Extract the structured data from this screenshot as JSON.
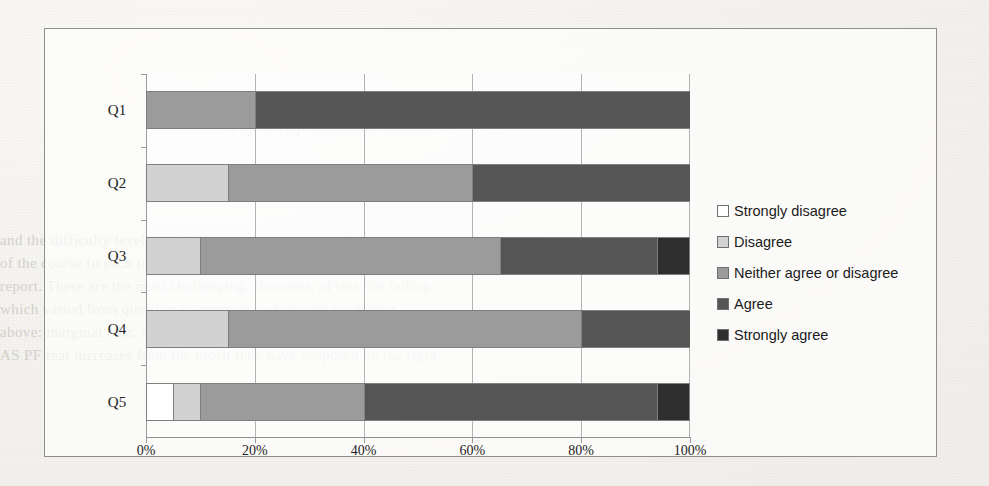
{
  "chart_data": {
    "type": "bar",
    "subtype": "stacked-horizontal-100-percent",
    "title": "",
    "xlabel": "",
    "ylabel": "",
    "categories": [
      "Q1",
      "Q2",
      "Q3",
      "Q4",
      "Q5"
    ],
    "xlim": [
      0,
      100
    ],
    "xticks": [
      "0%",
      "20%",
      "40%",
      "60%",
      "80%",
      "100%"
    ],
    "xtick_values": [
      0,
      20,
      40,
      60,
      80,
      100
    ],
    "grid": "vertical",
    "legend_position": "right",
    "series": [
      {
        "name": "Strongly disagree",
        "color": "#ffffff",
        "values": [
          0,
          0,
          0,
          0,
          5
        ]
      },
      {
        "name": "Disagree",
        "color": "#d2d2d2",
        "values": [
          0,
          15,
          10,
          15,
          5
        ]
      },
      {
        "name": "Neither agree or disagree",
        "color": "#9b9b9b",
        "values": [
          20,
          45,
          55,
          65,
          30
        ]
      },
      {
        "name": "Agree",
        "color": "#565656",
        "values": [
          80,
          40,
          29,
          20,
          54
        ]
      },
      {
        "name": "Strongly agree",
        "color": "#2f2f2f",
        "values": [
          0,
          0,
          6,
          0,
          6
        ]
      }
    ]
  },
  "legend": {
    "items": [
      {
        "label": "Strongly disagree"
      },
      {
        "label": "Disagree"
      },
      {
        "label": "Neither agree or disagree"
      },
      {
        "label": "Agree"
      },
      {
        "label": "Strongly agree"
      }
    ]
  },
  "page_bleed": {
    "caption": "Fig. 4. Representative Results",
    "lines": [
      "and the difficulty level required to address the curriculum-based support",
      "of the course to each topic.",
      "report. These are the most challenging. However, of this  5%  failing",
      "which varied from question to question and chapter to chapter.",
      "above: marginal cost, and the comparative period and study, were",
      "AS PF   real increases from the profit they have proposed on the right"
    ]
  }
}
